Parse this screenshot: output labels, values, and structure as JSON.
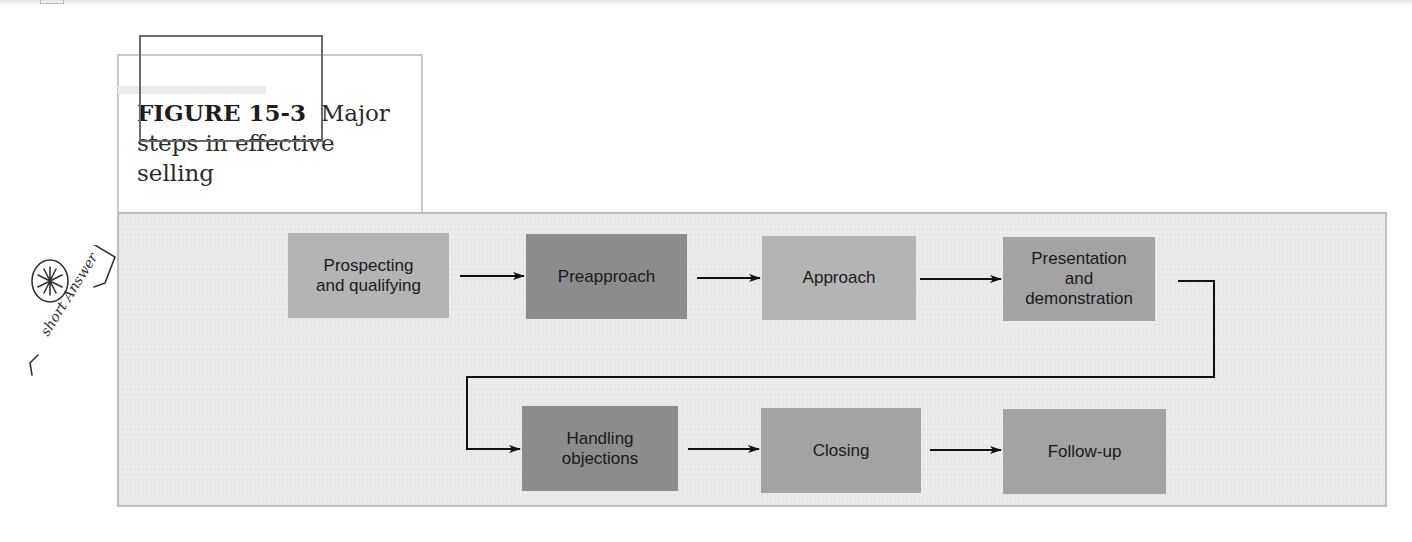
{
  "figure": {
    "label": "FIGURE 15-3",
    "title": "Major steps in effective selling",
    "title_line1": "Major",
    "title_line2": "steps in effective",
    "title_line3": "selling"
  },
  "steps": [
    {
      "label": "Prospecting and qualifying",
      "line1": "Prospecting",
      "line2": "and qualifying",
      "shade": "#b4b4b4"
    },
    {
      "label": "Preapproach",
      "line1": "Preapproach",
      "shade": "#8c8c8c"
    },
    {
      "label": "Approach",
      "line1": "Approach",
      "shade": "#b4b4b4"
    },
    {
      "label": "Presentation and demonstration",
      "line1": "Presentation",
      "line2": "and",
      "line3": "demonstration",
      "shade": "#a3a3a3"
    },
    {
      "label": "Handling objections",
      "line1": "Handling",
      "line2": "objections",
      "shade": "#8c8c8c"
    },
    {
      "label": "Closing",
      "line1": "Closing",
      "shade": "#a3a3a3"
    },
    {
      "label": "Follow-up",
      "line1": "Follow-up",
      "shade": "#a3a3a3"
    }
  ],
  "annotation": {
    "symbol": "✱",
    "text": "short Answer"
  }
}
